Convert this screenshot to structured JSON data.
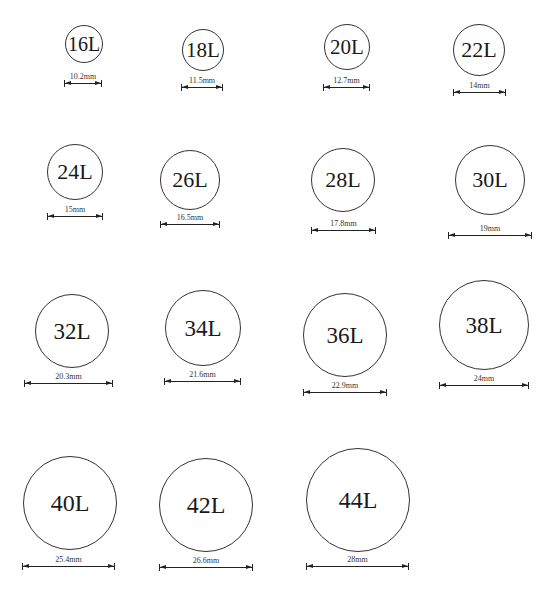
{
  "buttons": [
    {
      "size": "16L",
      "diameter": "10.2mm",
      "cx": 84,
      "cy": 44,
      "r": 19,
      "fs": 20,
      "line_y": 83,
      "x1": 64,
      "x2": 102
    },
    {
      "size": "18L",
      "diameter": "11.5mm",
      "cx": 203,
      "cy": 50,
      "r": 21,
      "fs": 21,
      "line_y": 87,
      "x1": 181,
      "x2": 223
    },
    {
      "size": "20L",
      "diameter": "12.7mm",
      "cx": 347,
      "cy": 47,
      "r": 23,
      "fs": 21,
      "line_y": 87,
      "x1": 323,
      "x2": 370
    },
    {
      "size": "22L",
      "diameter": "14mm",
      "cx": 479,
      "cy": 50,
      "r": 26,
      "fs": 22,
      "line_y": 92,
      "x1": 453,
      "x2": 506
    },
    {
      "size": "24L",
      "diameter": "15mm",
      "cx": 75,
      "cy": 172,
      "r": 28,
      "fs": 22,
      "line_y": 216,
      "x1": 47,
      "x2": 103
    },
    {
      "size": "26L",
      "diameter": "16.5mm",
      "cx": 190,
      "cy": 180,
      "r": 30,
      "fs": 22,
      "line_y": 224,
      "x1": 160,
      "x2": 220
    },
    {
      "size": "28L",
      "diameter": "17.8mm",
      "cx": 343,
      "cy": 180,
      "r": 32,
      "fs": 22,
      "line_y": 230,
      "x1": 311,
      "x2": 376
    },
    {
      "size": "30L",
      "diameter": "19mm",
      "cx": 490,
      "cy": 180,
      "r": 35,
      "fs": 22,
      "line_y": 235,
      "x1": 448,
      "x2": 532
    },
    {
      "size": "32L",
      "diameter": "20.3mm",
      "cx": 72,
      "cy": 331,
      "r": 37,
      "fs": 23,
      "line_y": 383,
      "x1": 24,
      "x2": 113
    },
    {
      "size": "34L",
      "diameter": "21.6mm",
      "cx": 203,
      "cy": 328,
      "r": 38,
      "fs": 23,
      "line_y": 381,
      "x1": 164,
      "x2": 241
    },
    {
      "size": "36L",
      "diameter": "22.9mm",
      "cx": 345,
      "cy": 335,
      "r": 42,
      "fs": 23,
      "line_y": 392,
      "x1": 303,
      "x2": 387
    },
    {
      "size": "38L",
      "diameter": "24mm",
      "cx": 484,
      "cy": 325,
      "r": 45,
      "fs": 23,
      "line_y": 385,
      "x1": 439,
      "x2": 529
    },
    {
      "size": "40L",
      "diameter": "25.4mm",
      "cx": 70,
      "cy": 503,
      "r": 47,
      "fs": 24,
      "line_y": 566,
      "x1": 22,
      "x2": 115
    },
    {
      "size": "42L",
      "diameter": "26.6mm",
      "cx": 206,
      "cy": 505,
      "r": 47,
      "fs": 24,
      "line_y": 567,
      "x1": 159,
      "x2": 253
    },
    {
      "size": "44L",
      "diameter": "28mm",
      "cx": 358,
      "cy": 500,
      "r": 52,
      "fs": 24,
      "line_y": 566,
      "x1": 306,
      "x2": 409
    }
  ],
  "colors": {
    "stroke": "#333333",
    "text": "#1a1a1a",
    "background": "#ffffff"
  }
}
